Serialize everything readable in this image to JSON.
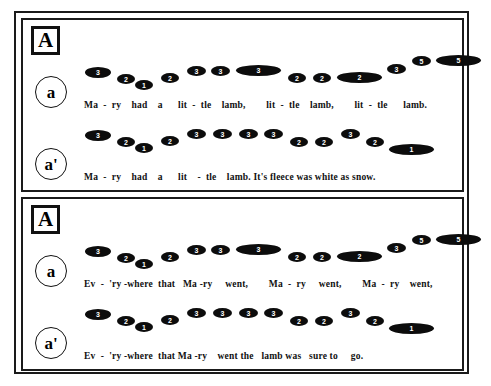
{
  "figure": {
    "type": "music-prosody-contour-diagram",
    "background": "#ffffff",
    "ink": "#0c0c0c"
  },
  "panels": [
    {
      "id": "panel-top",
      "section_label": "A",
      "rows": [
        {
          "id": "top-a",
          "marker": "a",
          "lyrics": "Ma  -  ry    had    a      lit  -  tle    lamb,        lit  -  tle    lamb,        lit  -  tle      lamb.",
          "lyrics_left": 61,
          "notes": [
            {
              "value": "3",
              "x": 62,
              "y": 17,
              "w": 26,
              "h": 11
            },
            {
              "value": "2",
              "x": 94,
              "y": 24,
              "w": 18,
              "h": 10
            },
            {
              "value": "1",
              "x": 112,
              "y": 30,
              "w": 18,
              "h": 10
            },
            {
              "value": "2",
              "x": 138,
              "y": 23,
              "w": 18,
              "h": 10
            },
            {
              "value": "3",
              "x": 164,
              "y": 16,
              "w": 19,
              "h": 10
            },
            {
              "value": "3",
              "x": 188,
              "y": 16,
              "w": 19,
              "h": 10
            },
            {
              "value": "3",
              "x": 213,
              "y": 15,
              "w": 45,
              "h": 11
            },
            {
              "value": "2",
              "x": 265,
              "y": 23,
              "w": 18,
              "h": 10
            },
            {
              "value": "2",
              "x": 290,
              "y": 23,
              "w": 18,
              "h": 10
            },
            {
              "value": "2",
              "x": 314,
              "y": 22,
              "w": 45,
              "h": 11
            },
            {
              "value": "3",
              "x": 364,
              "y": 14,
              "w": 19,
              "h": 10
            },
            {
              "value": "5",
              "x": 389,
              "y": 6,
              "w": 19,
              "h": 10
            },
            {
              "value": "5",
              "x": 413,
              "y": 5,
              "w": 45,
              "h": 11
            }
          ]
        },
        {
          "id": "top-ap",
          "marker": "a'",
          "lyrics": "Ma  -  ry    had    a      lit    -  tle    lamb. It's fleece was white as snow.",
          "lyrics_left": 61,
          "notes": [
            {
              "value": "3",
              "x": 62,
              "y": 8,
              "w": 26,
              "h": 11
            },
            {
              "value": "2",
              "x": 94,
              "y": 15,
              "w": 18,
              "h": 10
            },
            {
              "value": "1",
              "x": 112,
              "y": 21,
              "w": 18,
              "h": 10
            },
            {
              "value": "2",
              "x": 138,
              "y": 14,
              "w": 18,
              "h": 10
            },
            {
              "value": "3",
              "x": 164,
              "y": 7,
              "w": 19,
              "h": 10
            },
            {
              "value": "3",
              "x": 190,
              "y": 7,
              "w": 19,
              "h": 10
            },
            {
              "value": "3",
              "x": 216,
              "y": 7,
              "w": 19,
              "h": 10
            },
            {
              "value": "3",
              "x": 241,
              "y": 7,
              "w": 19,
              "h": 10
            },
            {
              "value": "2",
              "x": 267,
              "y": 15,
              "w": 18,
              "h": 10
            },
            {
              "value": "2",
              "x": 292,
              "y": 15,
              "w": 18,
              "h": 10
            },
            {
              "value": "3",
              "x": 318,
              "y": 7,
              "w": 19,
              "h": 10
            },
            {
              "value": "2",
              "x": 343,
              "y": 15,
              "w": 18,
              "h": 10
            },
            {
              "value": "1",
              "x": 366,
              "y": 22,
              "w": 45,
              "h": 11
            }
          ]
        }
      ]
    },
    {
      "id": "panel-bottom",
      "section_label": "A",
      "rows": [
        {
          "id": "bottom-a",
          "marker": "a",
          "lyrics": "Ev  -  'ry -where  that   Ma -ry     went,        Ma  -  ry     went,        Ma  -  ry    went,",
          "lyrics_left": 61,
          "notes": [
            {
              "value": "3",
              "x": 62,
              "y": 17,
              "w": 26,
              "h": 11
            },
            {
              "value": "2",
              "x": 94,
              "y": 24,
              "w": 18,
              "h": 10
            },
            {
              "value": "1",
              "x": 112,
              "y": 30,
              "w": 18,
              "h": 10
            },
            {
              "value": "2",
              "x": 138,
              "y": 23,
              "w": 18,
              "h": 10
            },
            {
              "value": "3",
              "x": 164,
              "y": 16,
              "w": 19,
              "h": 10
            },
            {
              "value": "3",
              "x": 188,
              "y": 16,
              "w": 19,
              "h": 10
            },
            {
              "value": "3",
              "x": 213,
              "y": 15,
              "w": 45,
              "h": 11
            },
            {
              "value": "2",
              "x": 265,
              "y": 23,
              "w": 18,
              "h": 10
            },
            {
              "value": "2",
              "x": 290,
              "y": 23,
              "w": 18,
              "h": 10
            },
            {
              "value": "2",
              "x": 314,
              "y": 22,
              "w": 45,
              "h": 11
            },
            {
              "value": "3",
              "x": 364,
              "y": 14,
              "w": 19,
              "h": 10
            },
            {
              "value": "5",
              "x": 389,
              "y": 6,
              "w": 19,
              "h": 10
            },
            {
              "value": "5",
              "x": 413,
              "y": 5,
              "w": 45,
              "h": 11
            }
          ]
        },
        {
          "id": "bottom-ap",
          "marker": "a'",
          "lyrics": "Ev  -  'ry -where  that Ma -ry    went the   lamb was   sure to     go.",
          "lyrics_left": 61,
          "notes": [
            {
              "value": "3",
              "x": 62,
              "y": 8,
              "w": 26,
              "h": 11
            },
            {
              "value": "2",
              "x": 94,
              "y": 15,
              "w": 18,
              "h": 10
            },
            {
              "value": "1",
              "x": 112,
              "y": 21,
              "w": 18,
              "h": 10
            },
            {
              "value": "2",
              "x": 138,
              "y": 14,
              "w": 18,
              "h": 10
            },
            {
              "value": "3",
              "x": 164,
              "y": 7,
              "w": 19,
              "h": 10
            },
            {
              "value": "3",
              "x": 190,
              "y": 7,
              "w": 19,
              "h": 10
            },
            {
              "value": "3",
              "x": 216,
              "y": 7,
              "w": 19,
              "h": 10
            },
            {
              "value": "3",
              "x": 241,
              "y": 7,
              "w": 19,
              "h": 10
            },
            {
              "value": "2",
              "x": 267,
              "y": 15,
              "w": 18,
              "h": 10
            },
            {
              "value": "2",
              "x": 292,
              "y": 15,
              "w": 18,
              "h": 10
            },
            {
              "value": "3",
              "x": 318,
              "y": 7,
              "w": 19,
              "h": 10
            },
            {
              "value": "2",
              "x": 343,
              "y": 15,
              "w": 18,
              "h": 10
            },
            {
              "value": "1",
              "x": 366,
              "y": 22,
              "w": 45,
              "h": 11
            }
          ]
        }
      ]
    }
  ]
}
